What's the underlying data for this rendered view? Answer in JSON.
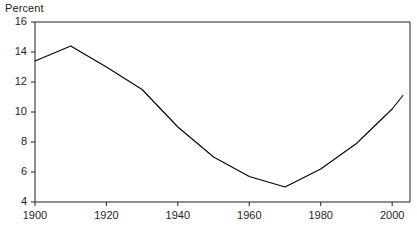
{
  "chart_data": {
    "type": "line",
    "title": "",
    "subtitle": "",
    "xlabel": "",
    "ylabel": "Percent",
    "ylabel_position": "top-left",
    "xlim": [
      1900,
      2005
    ],
    "ylim": [
      4,
      16
    ],
    "grid": false,
    "legend": false,
    "legend_position": "none",
    "line_color": "#000000",
    "frame_color": "#231f20",
    "background_color": "#ffffff",
    "x_ticks": [
      1900,
      1920,
      1940,
      1960,
      1980,
      2000
    ],
    "x_tick_labels": [
      "1900",
      "1920",
      "1940",
      "1960",
      "1980",
      "2000"
    ],
    "y_ticks": [
      4,
      6,
      8,
      10,
      12,
      14,
      16
    ],
    "y_tick_labels": [
      "4",
      "6",
      "8",
      "10",
      "12",
      "14",
      "16"
    ],
    "series": [
      {
        "name": "Percent",
        "x": [
          1900,
          1910,
          1920,
          1930,
          1940,
          1950,
          1960,
          1970,
          1980,
          1990,
          2000,
          2003
        ],
        "values": [
          13.4,
          14.4,
          13.0,
          11.5,
          9.0,
          7.0,
          5.7,
          5.0,
          6.2,
          7.9,
          10.2,
          11.1
        ]
      }
    ]
  }
}
